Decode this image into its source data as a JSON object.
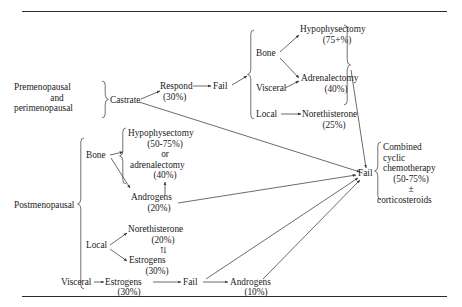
{
  "figure": {
    "top_rule": true,
    "bottom_rule": true
  },
  "premenopausal": {
    "group_label_line1": "Premenopausal",
    "group_label_line2": "and",
    "group_label_line3": "perimenopausal",
    "treatment": "Castrate",
    "respond": "Respond",
    "respond_pct": "(30%)",
    "fail": "Fail",
    "sites": {
      "bone": "Bone",
      "visceral": "Visceral",
      "local": "Local"
    },
    "options": [
      {
        "name": "Hypophysectomy",
        "pct": "(75+%)"
      },
      {
        "name": "Adrenalectomy",
        "pct": "(40%)"
      },
      {
        "name": "Norethisterone",
        "pct": "(25%)"
      }
    ]
  },
  "postmenopausal": {
    "group_label": "Postmenopausal",
    "sites": {
      "bone": "Bone",
      "local": "Local",
      "visceral": "Visceral"
    },
    "bone_branch": {
      "option1": "Hypophysectomy",
      "option1_pct": "(50-75%)",
      "conjunction": "or",
      "option2": "adrenalectomy",
      "option2_pct": "(40%)",
      "androgens": "Androgens",
      "androgens_pct": "(20%)"
    },
    "local_branch": {
      "norethisterone": "Norethisterone",
      "norethisterone_pct": "(20%)",
      "interchange_symbol": "⇅",
      "estrogens": "Estrogens",
      "estrogens_pct": "(30%)"
    },
    "visceral_branch": {
      "estrogens": "Estrogens",
      "estrogens_pct": "(30%)",
      "fail": "Fail",
      "androgens": "Androgens",
      "androgens_pct": "(10%)"
    }
  },
  "outcome": {
    "fail": "Fail",
    "line1": "Combined",
    "line2": "cyclic",
    "line3": "chemotherapy",
    "pct": "(50-75%)",
    "plus_minus": "±",
    "line5": "corticosteroids"
  },
  "colors": {
    "text": "#1a1a1a",
    "rule": "#2b2b2b",
    "connector": "#3a3a3a",
    "background": "#ffffff"
  }
}
